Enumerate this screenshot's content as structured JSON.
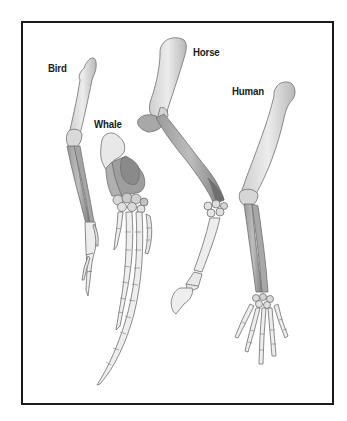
{
  "diagram": {
    "title": "",
    "frame_color": "#1a1a1a",
    "background": "#ffffff",
    "colors": {
      "bone_light": "#e6e6e6",
      "bone_mid": "#c4c4c4",
      "bone_dark": "#8c8c8c",
      "outline": "#6e6e6e"
    },
    "labels": [
      {
        "id": "bird",
        "text": "Bird",
        "x": 48,
        "y": 62
      },
      {
        "id": "whale",
        "text": "Whale",
        "x": 94,
        "y": 118
      },
      {
        "id": "horse",
        "text": "Horse",
        "x": 193,
        "y": 46
      },
      {
        "id": "human",
        "text": "Human",
        "x": 232,
        "y": 85
      }
    ]
  }
}
